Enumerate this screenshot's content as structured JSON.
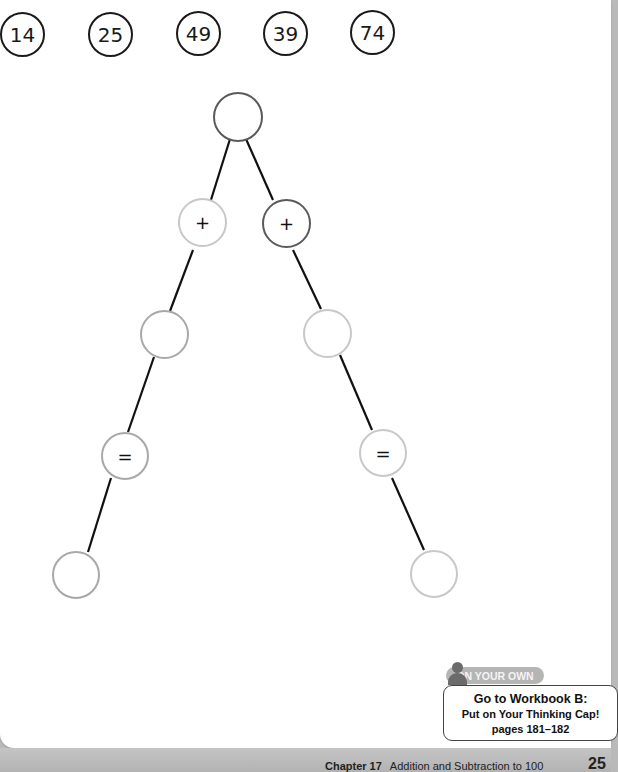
{
  "number_cards": [
    "14",
    "25",
    "49",
    "39",
    "74"
  ],
  "tree": {
    "root": "",
    "left_op": "+",
    "right_op": "+",
    "left_mid": "",
    "right_mid": "",
    "left_eq": "=",
    "right_eq": "=",
    "left_result": "",
    "right_result": ""
  },
  "callout": {
    "tag": "ON YOUR OWN",
    "line1": "Go to Workbook B:",
    "line2": "Put on Your Thinking Cap!",
    "line3": "pages 181–182"
  },
  "footer": {
    "chapter": "Chapter 17",
    "title": "Addition and Subtraction to 100",
    "page_number": "25"
  }
}
